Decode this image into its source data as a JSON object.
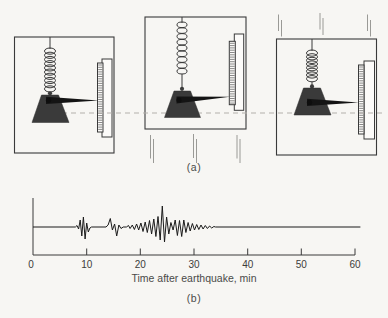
{
  "figure": {
    "part_a_label": "(a)",
    "part_b_label": "(b)"
  },
  "colors": {
    "ink": "#3a3a3a",
    "mass_fill": "#3a3a3a",
    "dashed_reference_line": "#b3b0ab",
    "ground_motion_lines": "#9a9a96",
    "background": "#f7f6f3",
    "trace": "#1b1b1b"
  },
  "chart_data": {
    "type": "line",
    "title": "",
    "xlabel": "Time after earthquake, min",
    "ylabel": "",
    "x_ticks": [
      0,
      10,
      20,
      30,
      40,
      50,
      60
    ],
    "xlim": [
      0,
      61
    ],
    "ylim": [
      -16,
      22
    ],
    "grid": false,
    "series": [
      {
        "name": "seismogram trace",
        "points": [
          [
            0,
            0
          ],
          [
            7.9,
            0
          ],
          [
            8.2,
            1.5
          ],
          [
            8.5,
            -2
          ],
          [
            8.8,
            7
          ],
          [
            9.1,
            -9
          ],
          [
            9.4,
            10
          ],
          [
            9.7,
            -12
          ],
          [
            10.0,
            4
          ],
          [
            10.3,
            -5
          ],
          [
            10.6,
            -1
          ],
          [
            10.9,
            0
          ],
          [
            13.6,
            0
          ],
          [
            14.0,
            2
          ],
          [
            14.4,
            8.5
          ],
          [
            14.8,
            -3
          ],
          [
            15.2,
            3
          ],
          [
            15.6,
            -9
          ],
          [
            16.0,
            2
          ],
          [
            16.4,
            -1.5
          ],
          [
            16.8,
            0
          ],
          [
            17.4,
            0
          ],
          [
            17.8,
            1.5
          ],
          [
            18.1,
            -1.5
          ],
          [
            18.5,
            2
          ],
          [
            18.9,
            -2.5
          ],
          [
            19.3,
            3
          ],
          [
            19.7,
            -3
          ],
          [
            20.1,
            4
          ],
          [
            20.5,
            -4.5
          ],
          [
            20.9,
            5
          ],
          [
            21.3,
            -5.5
          ],
          [
            21.7,
            6.5
          ],
          [
            22.1,
            -7
          ],
          [
            22.5,
            8
          ],
          [
            22.9,
            -9.5
          ],
          [
            23.3,
            10.5
          ],
          [
            23.7,
            -13
          ],
          [
            24.1,
            21
          ],
          [
            24.5,
            -15
          ],
          [
            24.9,
            10
          ],
          [
            25.3,
            -7
          ],
          [
            25.7,
            4.5
          ],
          [
            26.1,
            -3
          ],
          [
            26.5,
            7
          ],
          [
            26.9,
            -8.5
          ],
          [
            27.3,
            6.5
          ],
          [
            27.7,
            -9.5
          ],
          [
            28.1,
            7
          ],
          [
            28.5,
            -5.5
          ],
          [
            28.9,
            4.5
          ],
          [
            29.3,
            -4
          ],
          [
            29.7,
            3.5
          ],
          [
            30.1,
            -3
          ],
          [
            30.5,
            2.5
          ],
          [
            30.9,
            -2.5
          ],
          [
            31.3,
            2
          ],
          [
            31.7,
            -2
          ],
          [
            32.1,
            1.5
          ],
          [
            32.5,
            -1.5
          ],
          [
            32.9,
            1
          ],
          [
            33.3,
            -1
          ],
          [
            33.7,
            0.5
          ],
          [
            34.0,
            0
          ],
          [
            61,
            0
          ]
        ]
      }
    ]
  }
}
